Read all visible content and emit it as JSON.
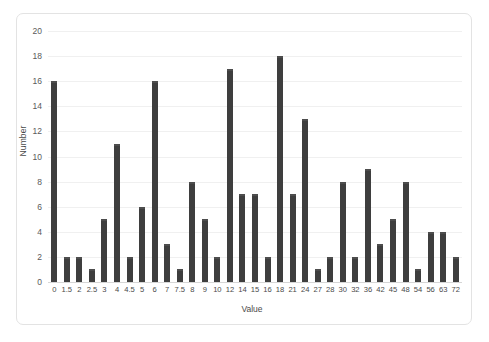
{
  "chart_data": {
    "type": "bar",
    "title": "",
    "xlabel": "Value",
    "ylabel": "Number",
    "categories": [
      "0",
      "1.5",
      "2",
      "2.5",
      "3",
      "4",
      "4.5",
      "5",
      "6",
      "7",
      "7.5",
      "8",
      "9",
      "10",
      "12",
      "14",
      "15",
      "16",
      "18",
      "21",
      "24",
      "27",
      "28",
      "30",
      "32",
      "36",
      "42",
      "45",
      "48",
      "54",
      "56",
      "63",
      "72"
    ],
    "values": [
      16,
      2,
      2,
      1,
      5,
      11,
      2,
      6,
      16,
      3,
      1,
      8,
      5,
      2,
      17,
      7,
      7,
      2,
      18,
      7,
      13,
      1,
      2,
      8,
      2,
      9,
      3,
      5,
      8,
      1,
      4,
      4,
      2
    ],
    "ylim": [
      0,
      20
    ],
    "yticks": [
      0,
      2,
      4,
      6,
      8,
      10,
      12,
      14,
      16,
      18,
      20
    ],
    "ytick_labels": [
      "0",
      "2",
      "4",
      "6",
      "8",
      "10",
      "12",
      "14",
      "16",
      "18",
      "20"
    ],
    "grid": true,
    "legend": false,
    "bar_color": "#3e3e3e",
    "gridline_color": "#f0f0f0",
    "border_color": "#e3e3e3",
    "axis_label_color": "#4a4a4a"
  }
}
